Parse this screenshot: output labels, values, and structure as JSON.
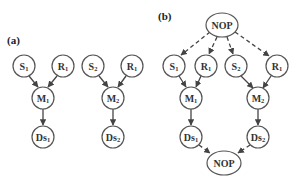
{
  "panels": [
    {
      "label": "(a)",
      "graphs": [
        {
          "nodes": [
            {
              "id": "S1",
              "main": "S",
              "sub": "1"
            },
            {
              "id": "R1",
              "main": "R",
              "sub": "1"
            },
            {
              "id": "M1",
              "main": "M",
              "sub": "1"
            },
            {
              "id": "Ds1",
              "main": "Ds",
              "sub": "1"
            }
          ],
          "edges": [
            {
              "from": "S1",
              "to": "M1",
              "style": "solid"
            },
            {
              "from": "R1",
              "to": "M1",
              "style": "solid"
            },
            {
              "from": "M1",
              "to": "Ds1",
              "style": "solid"
            }
          ]
        },
        {
          "nodes": [
            {
              "id": "S2",
              "main": "S",
              "sub": "2"
            },
            {
              "id": "R1",
              "main": "R",
              "sub": "1"
            },
            {
              "id": "M2",
              "main": "M",
              "sub": "2"
            },
            {
              "id": "Ds2",
              "main": "Ds",
              "sub": "2"
            }
          ],
          "edges": [
            {
              "from": "S2",
              "to": "M2",
              "style": "solid"
            },
            {
              "from": "R1",
              "to": "M2",
              "style": "solid"
            },
            {
              "from": "M2",
              "to": "Ds2",
              "style": "solid"
            }
          ]
        }
      ]
    },
    {
      "label": "(b)",
      "nodes": [
        {
          "id": "NOP_top",
          "main": "NOP",
          "sub": ""
        },
        {
          "id": "S1",
          "main": "S",
          "sub": "1"
        },
        {
          "id": "R1a",
          "main": "R",
          "sub": "1"
        },
        {
          "id": "S2",
          "main": "S",
          "sub": "2"
        },
        {
          "id": "R1b",
          "main": "R",
          "sub": "1"
        },
        {
          "id": "M1",
          "main": "M",
          "sub": "1"
        },
        {
          "id": "M2",
          "main": "M",
          "sub": "2"
        },
        {
          "id": "Ds1",
          "main": "Ds",
          "sub": "1"
        },
        {
          "id": "Ds2",
          "main": "Ds",
          "sub": "2"
        },
        {
          "id": "NOP_bottom",
          "main": "NOP",
          "sub": ""
        }
      ],
      "edges": [
        {
          "from": "NOP_top",
          "to": "S1",
          "style": "dashed"
        },
        {
          "from": "NOP_top",
          "to": "R1a",
          "style": "dashed"
        },
        {
          "from": "NOP_top",
          "to": "S2",
          "style": "dashed"
        },
        {
          "from": "NOP_top",
          "to": "R1b",
          "style": "dashed"
        },
        {
          "from": "S1",
          "to": "M1",
          "style": "solid"
        },
        {
          "from": "R1a",
          "to": "M1",
          "style": "solid"
        },
        {
          "from": "S2",
          "to": "M2",
          "style": "solid"
        },
        {
          "from": "R1b",
          "to": "M2",
          "style": "solid"
        },
        {
          "from": "M1",
          "to": "Ds1",
          "style": "solid"
        },
        {
          "from": "M2",
          "to": "Ds2",
          "style": "solid"
        },
        {
          "from": "Ds1",
          "to": "NOP_bottom",
          "style": "dashed"
        },
        {
          "from": "Ds2",
          "to": "NOP_bottom",
          "style": "dashed"
        }
      ]
    }
  ]
}
